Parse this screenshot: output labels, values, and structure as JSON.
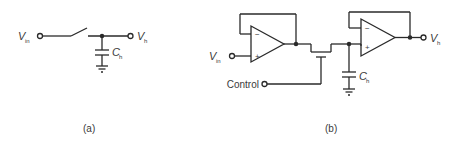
{
  "diagram_a": {
    "input_label": "V",
    "input_sub": "in",
    "output_label": "V",
    "output_sub": "h",
    "cap_label": "C",
    "cap_sub": "h",
    "caption": "(a)"
  },
  "diagram_b": {
    "input_label": "V",
    "input_sub": "in",
    "output_label": "V",
    "output_sub": "h",
    "cap_label": "C",
    "cap_sub": "h",
    "control_label": "Control",
    "opamp1_minus": "−",
    "opamp1_plus": "+",
    "opamp2_minus": "−",
    "opamp2_plus": "+",
    "caption": "(b)"
  }
}
